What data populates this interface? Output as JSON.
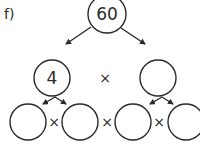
{
  "label": "f)",
  "root": {
    "value": "60",
    "cx": 107,
    "cy": 14,
    "r": 19
  },
  "middle": [
    {
      "value": "4",
      "cx": 52,
      "cy": 78,
      "r": 18
    },
    {
      "value": "",
      "cx": 158,
      "cy": 78,
      "r": 18
    }
  ],
  "middle_operator": {
    "symbol": "×",
    "x": 105,
    "y": 78
  },
  "bottom": [
    {
      "value": "",
      "cx": 28,
      "cy": 122,
      "r": 18
    },
    {
      "value": "",
      "cx": 80,
      "cy": 122,
      "r": 18
    },
    {
      "value": "",
      "cx": 133,
      "cy": 122,
      "r": 18
    },
    {
      "value": "",
      "cx": 186,
      "cy": 122,
      "r": 18
    }
  ],
  "bottom_operators": [
    {
      "symbol": "×",
      "x": 54,
      "y": 122
    },
    {
      "symbol": "×",
      "x": 107,
      "y": 122
    },
    {
      "symbol": "×",
      "x": 159,
      "y": 122
    }
  ],
  "colors": {
    "stroke": "#2a2a2a",
    "background": "#ffffff"
  }
}
